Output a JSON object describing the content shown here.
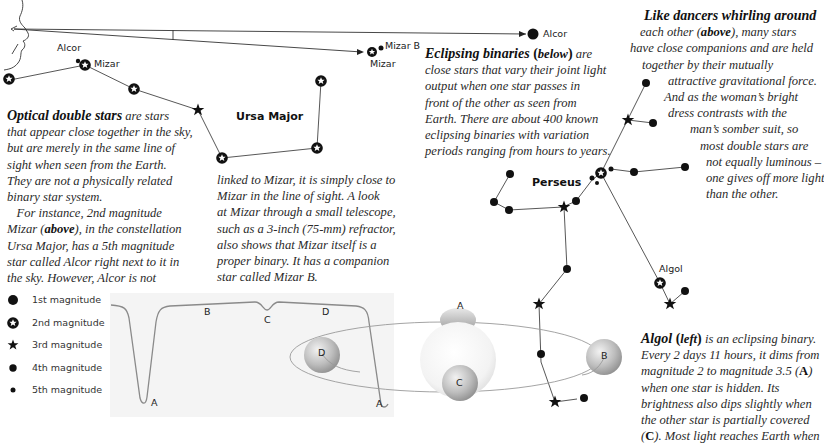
{
  "sightline": {
    "labels": {
      "alcor_near": "Alcor",
      "mizar_near": "Mizar",
      "mizar_b": "Mizar B",
      "mizar_far": "Mizar",
      "alcor_far": "Alcor"
    }
  },
  "constellations": {
    "ursa_major": "Ursa Major",
    "perseus": "Perseus",
    "algol_label": "Algol"
  },
  "text_optical": {
    "lead": "Optical double stars",
    "lines": [
      " are stars",
      "that appear close together in the sky,",
      "but are merely in the same line of",
      "sight when seen from the Earth.",
      "They are not a physically related",
      "binary star system.",
      "   For instance, 2nd magnitude"
    ],
    "mizar_line_pre": "Mizar (",
    "mizar_line_bold": "above",
    "mizar_line_post": "), in the constellation",
    "lines_after": [
      "Ursa Major, has a 5th magnitude",
      "star called Alcor right next to it in",
      "the sky. However, Alcor is not"
    ]
  },
  "text_optical_cont": {
    "lines": [
      "linked to Mizar, it is simply close to",
      "Mizar in the line of sight. A look",
      "at Mizar through a small telescope,",
      "such as a 3-inch (75-mm) refractor,",
      "also shows that Mizar itself is a",
      "proper binary. It has a companion",
      "star called Mizar B."
    ]
  },
  "text_eclipsing": {
    "lead": "Eclipsing binaries",
    "paren_bold": "below",
    "first_tail": " are",
    "lines": [
      "close stars that vary their joint light",
      "output when one star passes in",
      "front of the other as seen from",
      "Earth. There are about 400 known",
      "eclipsing binaries with variation",
      "periods ranging from hours to years."
    ]
  },
  "text_dancers": {
    "lead": "Like dancers whirling around",
    "line1_pre": "each other (",
    "line1_bold": "above",
    "line1_post": "), many stars",
    "lines": [
      "have close companions and are held",
      "together by their mutually",
      "attractive gravitational force.",
      "And as the woman’s bright",
      "dress contrasts with the",
      "man’s somber suit, so",
      "most double stars are",
      "not equally luminous –",
      "one gives off more light",
      "than the other."
    ]
  },
  "text_algol": {
    "lead": "Algol",
    "paren_bold": "left",
    "first_tail": " is an eclipsing binary.",
    "line2": "Every 2 days 11 hours, it dims from",
    "line3_pre": "magnitude 2 to magnitude 3.5 (",
    "line3_bold": "A",
    "line3_post": ")",
    "line4": "when one star is hidden. Its",
    "line5": "brightness also dips slightly when",
    "line6": "the other star is partially covered",
    "line7_pre": "(",
    "line7_bold": "C",
    "line7_post": "). Most light reaches Earth when"
  },
  "legend": {
    "items": [
      {
        "label": "1st magnitude",
        "icon": "large-filled-dot"
      },
      {
        "label": "2nd magnitude",
        "icon": "ring-star"
      },
      {
        "label": "3rd magnitude",
        "icon": "star"
      },
      {
        "label": "4th magnitude",
        "icon": "medium-dot"
      },
      {
        "label": "5th magnitude",
        "icon": "small-dot"
      }
    ]
  },
  "light_curve": {
    "point_labels": [
      "A",
      "B",
      "C",
      "D",
      "A"
    ]
  },
  "orbit_diagram": {
    "labels": {
      "A": "A",
      "B": "B",
      "C": "C",
      "D": "D"
    }
  },
  "colors": {
    "ink": "#111111",
    "curve": "#8a8a8a",
    "curve_bg": "#f3f3f3",
    "sphere_light": "#f4f4f4",
    "sphere_dark": "#9c9c9c"
  }
}
